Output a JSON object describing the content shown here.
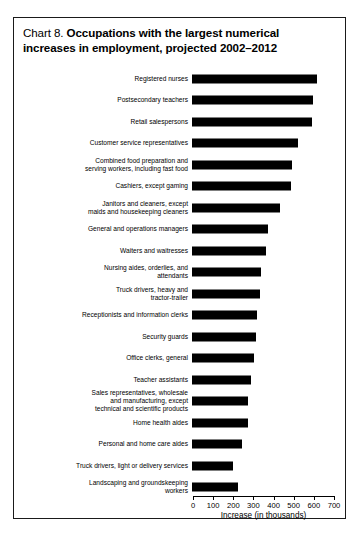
{
  "title": {
    "chart_number": "Chart 8.",
    "line1": "Occupations with the largest numerical",
    "line2": "increases in employment, projected 2002–2012"
  },
  "axis": {
    "x_title": "Increase (in thousands)",
    "ticks": [
      "0",
      "100",
      "200",
      "300",
      "400",
      "500",
      "600",
      "700"
    ]
  },
  "colors": {
    "bar": "#000000",
    "frame": "#1a1a1a",
    "background": "#ffffff",
    "text": "#000000"
  },
  "chart_data": {
    "type": "bar",
    "orientation": "horizontal",
    "title": "Chart 8. Occupations with the largest numerical increases in employment, projected 2002–2012",
    "xlabel": "Increase (in thousands)",
    "ylabel": "",
    "xlim": [
      0,
      700
    ],
    "xticks": [
      0,
      100,
      200,
      300,
      400,
      500,
      600,
      700
    ],
    "grid": false,
    "legend": false,
    "categories": [
      "Registered nurses",
      "Postsecondary teachers",
      "Retail salespersons",
      "Customer service representatives",
      "Combined food preparation and serving workers, including fast food",
      "Cashiers, except gaming",
      "Janitors and cleaners, except maids and housekeeping cleaners",
      "General and operations managers",
      "Waiters and waitresses",
      "Nursing aides, orderlies, and attendants",
      "Truck drivers, heavy and tractor-trailer",
      "Receptionists and information clerks",
      "Security guards",
      "Office clerks, general",
      "Teacher assistants",
      "Sales representatives, wholesale and manufacturing, except technical and scientific products",
      "Home health aides",
      "Personal and home care aides",
      "Truck drivers, light or delivery services",
      "Landscaping and groundskeeping workers"
    ],
    "values": [
      623,
      603,
      596,
      525,
      496,
      492,
      435,
      376,
      367,
      343,
      337,
      325,
      317,
      310,
      294,
      279,
      279,
      246,
      203,
      230
    ]
  },
  "rows": [
    {
      "label_lines": [
        "Registered nurses"
      ],
      "value": 623
    },
    {
      "label_lines": [
        "Postsecondary teachers"
      ],
      "value": 603
    },
    {
      "label_lines": [
        "Retail salespersons"
      ],
      "value": 596
    },
    {
      "label_lines": [
        "Customer service representatives"
      ],
      "value": 525
    },
    {
      "label_lines": [
        "Combined food preparation and",
        "serving workers, including fast food"
      ],
      "value": 496
    },
    {
      "label_lines": [
        "Cashiers, except gaming"
      ],
      "value": 492
    },
    {
      "label_lines": [
        "Janitors and cleaners, except",
        "maids and housekeeping cleaners"
      ],
      "value": 435
    },
    {
      "label_lines": [
        "General and operations managers"
      ],
      "value": 376
    },
    {
      "label_lines": [
        "Waiters and waitresses"
      ],
      "value": 367
    },
    {
      "label_lines": [
        "Nursing aides, orderlies, and",
        "attendants"
      ],
      "value": 343
    },
    {
      "label_lines": [
        "Truck drivers, heavy and",
        "tractor-trailer"
      ],
      "value": 337
    },
    {
      "label_lines": [
        "Receptionists and information clerks"
      ],
      "value": 325
    },
    {
      "label_lines": [
        "Security guards"
      ],
      "value": 317
    },
    {
      "label_lines": [
        "Office clerks, general"
      ],
      "value": 310
    },
    {
      "label_lines": [
        "Teacher assistants"
      ],
      "value": 294
    },
    {
      "label_lines": [
        "Sales representatives, wholesale",
        "and manufacturing, except",
        "technical and scientific products"
      ],
      "value": 279
    },
    {
      "label_lines": [
        "Home health aides"
      ],
      "value": 279
    },
    {
      "label_lines": [
        "Personal and home care aides"
      ],
      "value": 246
    },
    {
      "label_lines": [
        "Truck drivers, light or delivery services"
      ],
      "value": 203
    },
    {
      "label_lines": [
        "Landscaping and groundskeeping",
        "workers"
      ],
      "value": 230
    }
  ]
}
